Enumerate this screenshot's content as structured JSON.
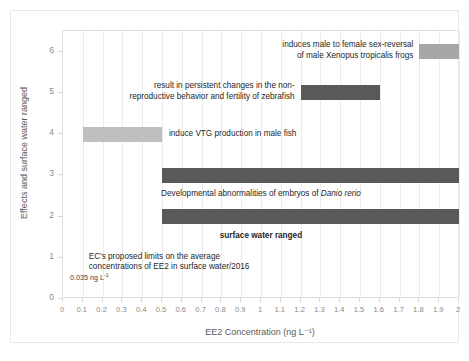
{
  "chart_data": {
    "type": "bar",
    "orientation": "horizontal",
    "title": "",
    "xlabel": "EE2 Concentration (ng L⁻¹)",
    "ylabel": "Effects and surface water ranged",
    "xlim": [
      0,
      2
    ],
    "ylim": [
      0,
      6.5
    ],
    "grid": "vertical-only",
    "legend": "none",
    "xticks": [
      "0",
      "0.1",
      "0.2",
      "0.3",
      "0.4",
      "0.5",
      "0.6",
      "0.7",
      "0.8",
      "0.9",
      "1",
      "1.1",
      "1.2",
      "1.3",
      "1.4",
      "1.5",
      "1.6",
      "1.7",
      "1.8",
      "1.9",
      "2"
    ],
    "yticks": [
      "0",
      "1",
      "2",
      "3",
      "4",
      "5",
      "6"
    ],
    "bars": [
      {
        "category": 6,
        "x_start": 1.8,
        "x_end": 2.0,
        "color": "#a6a6a6",
        "label": "induces male to female sex-reversal of male Xenopus tropicalis frogs",
        "label_line1": "induces male to female sex-reversal",
        "label_line2": "of male Xenopus tropicalis frogs",
        "label_position": "left-of-bar"
      },
      {
        "category": 5,
        "x_start": 1.2,
        "x_end": 1.6,
        "color": "#595959",
        "label": "result in persistent changes in the non-reproductive behavior and fertility of zebrafish",
        "label_line1": "result in persistent changes in the non-",
        "label_line2": "reproductive behavior and fertility of zebrafish",
        "label_position": "left-of-bar"
      },
      {
        "category": 4,
        "x_start": 0.1,
        "x_end": 0.5,
        "color": "#bfbfbf",
        "label": "induce VTG production in male fish",
        "label_position": "right-of-bar"
      },
      {
        "category": 3,
        "x_start": 0.5,
        "x_end": 2.0,
        "color": "#595959",
        "label": "Developmental abnormalities of embryos of Danio rerio",
        "label_plain": "Developmental abnormalities of embryos of ",
        "label_italic": "Danio rerio",
        "label_position": "below-bar"
      },
      {
        "category": 2,
        "x_start": 0.5,
        "x_end": 2.0,
        "color": "#595959",
        "label": "surface water ranged",
        "label_position": "below-bar",
        "label_bold": true
      }
    ],
    "annotations": [
      {
        "name": "ec-proposed-limit",
        "line1": "EC's proposed limits on the average",
        "line2": "concentrations of EE2 in surface water/2016",
        "x": 0.13,
        "y": 1.0
      },
      {
        "name": "threshold-value",
        "value": "0.035 ng L",
        "superscript": "-1",
        "x": 0.035,
        "y": 0.55
      }
    ]
  },
  "colors": {
    "bar_light": "#bfbfbf",
    "bar_medium": "#a6a6a6",
    "bar_dark": "#595959",
    "gridline": "#ebebeb",
    "axis_text": "#8a8a8a",
    "label_text": "#262626"
  }
}
